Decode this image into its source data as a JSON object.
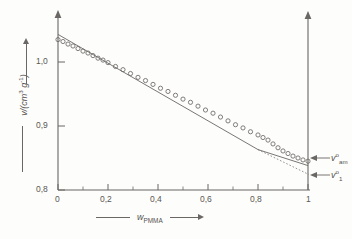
{
  "chart_data": {
    "type": "scatter",
    "title": "",
    "subtitle": "",
    "xlabel": "w_PMMA",
    "ylabel": "v/(cm^3 g^-1)",
    "xlim": [
      0,
      1
    ],
    "ylim": [
      0.8,
      1.05
    ],
    "grid": false,
    "legend": "none",
    "x_ticks": [
      0,
      0.2,
      0.4,
      0.6,
      0.8,
      1
    ],
    "x_tick_labels": [
      "0",
      "0,2",
      "0,4",
      "0,6",
      "0,8",
      "1"
    ],
    "y_ticks": [
      0.8,
      0.9,
      1.0
    ],
    "y_tick_labels": [
      "0,8",
      "0,9",
      "1,0"
    ],
    "marker": "open-circle",
    "series": [
      {
        "name": "specific volume",
        "marker": "open-circle",
        "x": [
          0.0,
          0.02,
          0.04,
          0.06,
          0.08,
          0.1,
          0.12,
          0.14,
          0.16,
          0.18,
          0.2,
          0.23,
          0.26,
          0.29,
          0.32,
          0.35,
          0.38,
          0.41,
          0.44,
          0.47,
          0.5,
          0.53,
          0.56,
          0.59,
          0.62,
          0.65,
          0.68,
          0.71,
          0.74,
          0.77,
          0.8,
          0.82,
          0.84,
          0.86,
          0.88,
          0.9,
          0.92,
          0.94,
          0.96,
          0.98,
          1.0
        ],
        "y": [
          1.035,
          1.032,
          1.028,
          1.025,
          1.021,
          1.017,
          1.014,
          1.01,
          1.006,
          1.003,
          0.999,
          0.993,
          0.988,
          0.982,
          0.976,
          0.971,
          0.965,
          0.959,
          0.954,
          0.948,
          0.942,
          0.937,
          0.931,
          0.925,
          0.92,
          0.914,
          0.908,
          0.902,
          0.897,
          0.891,
          0.886,
          0.882,
          0.878,
          0.872,
          0.866,
          0.861,
          0.857,
          0.853,
          0.85,
          0.847,
          0.845
        ]
      }
    ],
    "fit_line": {
      "name": "linear fit (solid)",
      "style": "solid",
      "points": [
        [
          0.0,
          1.0355
        ],
        [
          0.8,
          0.8855
        ],
        [
          1.0,
          0.8455
        ]
      ]
    },
    "extrapolation_line": {
      "name": "extrapolation (dotted)",
      "style": "dotted",
      "points": [
        [
          0.8,
          0.8855
        ],
        [
          1.0,
          0.8255
        ]
      ]
    },
    "annotations": [
      {
        "name": "v-amorphous",
        "label_html": "v<sup>o</sup><sub>am</sub>",
        "label_text": "v°am",
        "x": 1.0,
        "y": 0.845,
        "arrow": "left"
      },
      {
        "name": "v-crystalline",
        "label_html": "v<sup>o</sup><sub>1</sub>",
        "label_text": "v°1",
        "x": 1.0,
        "y": 0.8255,
        "arrow": "left"
      }
    ]
  },
  "axes": {
    "y_axis_label_html": "v/(cm<sup>3</sup> g<sup>-1</sup>)",
    "x_axis_label_html": "w<sub>PMMA</sub>",
    "y_tick_0": "0,8",
    "y_tick_1": "0,9",
    "y_tick_2": "1,0",
    "x_tick_0": "0",
    "x_tick_1": "0,2",
    "x_tick_2": "0,4",
    "x_tick_3": "0,6",
    "x_tick_4": "0,8",
    "x_tick_5": "1"
  },
  "annotation_labels": {
    "v_am_html": "v<sup>o</sup><sub>am</sub>",
    "v_1_html": "v<sup>o</sup><sub>1</sub>"
  },
  "colors": {
    "ink": "#5a5754",
    "line": "#6a6764",
    "marker_stroke": "#6b6865",
    "paper": "#fdfdfb"
  }
}
